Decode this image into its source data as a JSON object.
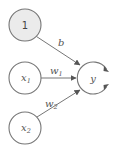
{
  "diagram": {
    "type": "perceptron",
    "nodes": [
      {
        "id": "bias",
        "label": "1",
        "subscript": "",
        "cx": 25,
        "cy": 25,
        "r": 16,
        "fill": "#ebebeb"
      },
      {
        "id": "x1",
        "label": "x",
        "subscript": "1",
        "cx": 25,
        "cy": 78,
        "r": 16,
        "fill": "#ffffff"
      },
      {
        "id": "x2",
        "label": "x",
        "subscript": "2",
        "cx": 25,
        "cy": 128,
        "r": 16,
        "fill": "#ffffff"
      },
      {
        "id": "y",
        "label": "y",
        "subscript": "",
        "cx": 93,
        "cy": 78,
        "r": 16,
        "fill": "#ffffff"
      }
    ],
    "edges": [
      {
        "from": "bias",
        "to": "y",
        "label": "b",
        "subscript": ""
      },
      {
        "from": "x1",
        "to": "y",
        "label": "w",
        "subscript": "1"
      },
      {
        "from": "x2",
        "to": "y",
        "label": "w",
        "subscript": "2"
      }
    ],
    "output_arrows": 2,
    "stroke_color": "#777777"
  }
}
